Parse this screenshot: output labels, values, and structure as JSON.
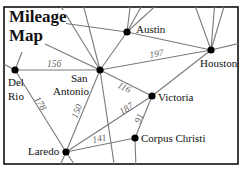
{
  "title": {
    "line1": "Mileage",
    "line2": "Map"
  },
  "cities": [
    {
      "name": "Austin",
      "x": 127,
      "y": 32
    },
    {
      "name": "Houston",
      "x": 211,
      "y": 50
    },
    {
      "name": "Del Rio",
      "line1": "Del",
      "line2": "Rio",
      "x": 15,
      "y": 70
    },
    {
      "name": "San Antonio",
      "line1": "San",
      "line2": "Antonio",
      "x": 100,
      "y": 70
    },
    {
      "name": "Victoria",
      "x": 152,
      "y": 96
    },
    {
      "name": "Corpus Christi",
      "x": 135,
      "y": 138
    },
    {
      "name": "Laredo",
      "x": 66,
      "y": 152
    }
  ],
  "distances": [
    {
      "from": "Del Rio",
      "to": "San Antonio",
      "miles": "156"
    },
    {
      "from": "San Antonio",
      "to": "Houston",
      "miles": "197"
    },
    {
      "from": "San Antonio",
      "to": "Victoria",
      "miles": "116"
    },
    {
      "from": "Del Rio",
      "to": "Laredo",
      "miles": "178"
    },
    {
      "from": "San Antonio",
      "to": "Laredo",
      "miles": "150"
    },
    {
      "from": "Laredo",
      "to": "Victoria",
      "miles": "187"
    },
    {
      "from": "Victoria",
      "to": "Corpus Christi",
      "miles": "91"
    },
    {
      "from": "Laredo",
      "to": "Corpus Christi",
      "miles": "141"
    }
  ],
  "colors": {
    "road": "#7a7a7a",
    "frame": "#111111",
    "node": "#000000",
    "distance_label": "#666666"
  }
}
